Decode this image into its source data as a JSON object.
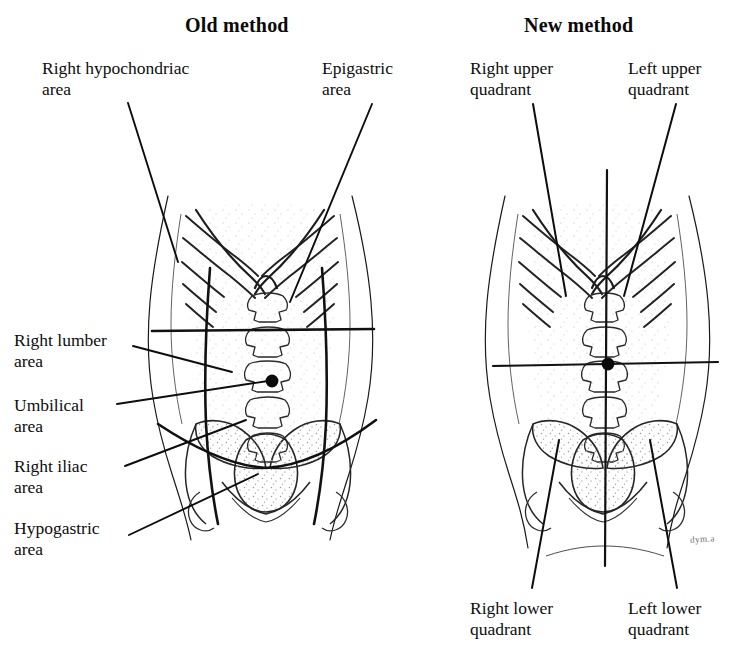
{
  "figure": {
    "caption_titles": {
      "old": "Old method",
      "new": "New method"
    },
    "signature": "dym.a",
    "colors": {
      "ink": "#0d0d0d",
      "region_line": "#111111",
      "body_outline": "#1a1a1a",
      "bone_outline": "#262626",
      "stipple": "#9a9a9a",
      "background": "#ffffff"
    }
  },
  "old_method": {
    "title": "Old method",
    "scheme": "nine abdominal regions",
    "labels": {
      "right_hypochondriac": "Right hypochondriac\narea",
      "epigastric": "Epigastric\narea",
      "right_lumber": "Right lumber\narea",
      "umbilical": "Umbilical\narea",
      "right_iliac": "Right iliac\narea",
      "hypogastric": "Hypogastric\narea"
    },
    "label_list": [
      "Right hypochondriac area",
      "Epigastric area",
      "Right lumber area",
      "Umbilical area",
      "Right iliac area",
      "Hypogastric area"
    ]
  },
  "new_method": {
    "title": "New method",
    "scheme": "four abdominal quadrants",
    "labels": {
      "right_upper_quadrant": "Right upper\nquadrant",
      "left_upper_quadrant": "Left upper\nquadrant",
      "right_lower_quadrant": "Right lower\nquadrant",
      "left_lower_quadrant": "Left lower\nquadrant"
    },
    "label_list": [
      "Right upper quadrant",
      "Left upper quadrant",
      "Right lower quadrant",
      "Left lower quadrant"
    ]
  }
}
